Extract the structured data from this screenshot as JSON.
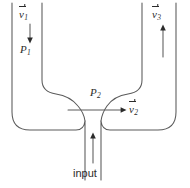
{
  "figure": {
    "type": "physics-line-diagram",
    "stroke_color": "#5a5a5a",
    "text_color": "#2b2b2b",
    "background_color": "#ffffff"
  },
  "labels": {
    "v1": {
      "symbol": "v",
      "subscript": "1",
      "vector": true
    },
    "v2": {
      "symbol": "v",
      "subscript": "2",
      "vector": true
    },
    "v3": {
      "symbol": "v",
      "subscript": "3",
      "vector": true
    },
    "p1": {
      "symbol": "P",
      "subscript": "1",
      "vector": false
    },
    "p2": {
      "symbol": "P",
      "subscript": "2",
      "vector": false
    },
    "input": "input"
  },
  "arrows": [
    {
      "name": "v1-flow-arrow",
      "direction": "down",
      "x": 30,
      "y1": 24,
      "y2": 41
    },
    {
      "name": "v3-flow-arrow",
      "direction": "up",
      "x": 163,
      "y1": 57,
      "y2": 26
    },
    {
      "name": "v2-flow-arrow",
      "direction": "right",
      "y": 110,
      "x1": 68,
      "x2": 126
    },
    {
      "name": "input-flow-arrow",
      "direction": "up",
      "x": 93,
      "y1": 163,
      "y2": 133
    }
  ],
  "geometry": {
    "outer_left_wall_x": 12,
    "inner_left_wall_x": 42,
    "inner_right_wall_x": 142,
    "outer_right_wall_x": 176,
    "top_y": 3,
    "outer_bottom_y": 131,
    "throat_y": 118,
    "inner_shoulder_y": 88,
    "input_tube_left_x": 85,
    "input_tube_right_x": 101,
    "input_tube_bottom_y": 180,
    "corner_radius": 18
  }
}
